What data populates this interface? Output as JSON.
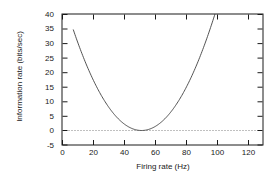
{
  "chart_data": {
    "type": "line",
    "title": "",
    "xlabel": "Firing rate (Hz)",
    "ylabel": "Information rate (bits/sec)",
    "xlim": [
      0,
      129
    ],
    "ylim": [
      -5,
      40
    ],
    "xticks": [
      0,
      20,
      40,
      60,
      80,
      100,
      120
    ],
    "xtick_labels": [
      "0",
      "20",
      "40",
      "60",
      "80",
      "100",
      "120"
    ],
    "yticks": [
      -5,
      0,
      5,
      10,
      15,
      20,
      25,
      30,
      35,
      40
    ],
    "ytick_labels": [
      "-5",
      "0",
      "5",
      "10",
      "15",
      "20",
      "25",
      "30",
      "35",
      "40"
    ],
    "grid": false,
    "legend": null,
    "line_color": "#404040",
    "reference_line": {
      "name": "zero-line",
      "y": 0,
      "style": "dotted",
      "color": "#808080"
    },
    "series": [
      {
        "name": "information-rate-curve",
        "minimum_x": 51,
        "minimum_y": 0,
        "x": [
          7,
          10,
          14,
          18,
          22,
          26,
          30,
          34,
          38,
          42,
          46,
          50,
          51,
          54,
          58,
          62,
          66,
          70,
          74,
          78,
          82,
          86,
          90,
          94,
          98,
          102,
          106,
          110,
          112
        ],
        "y": [
          43.0,
          37.0,
          29.8,
          23.3,
          17.5,
          12.4,
          8.1,
          4.7,
          2.2,
          0.7,
          0.1,
          0.0,
          0.0,
          0.3,
          1.4,
          3.3,
          6.0,
          9.3,
          13.2,
          17.6,
          22.4,
          27.6,
          33.1,
          38.8,
          44.7,
          50.8,
          57.0,
          63.4,
          66.7
        ]
      }
    ]
  },
  "axes": {
    "frame_color": "#1a1a1a"
  }
}
